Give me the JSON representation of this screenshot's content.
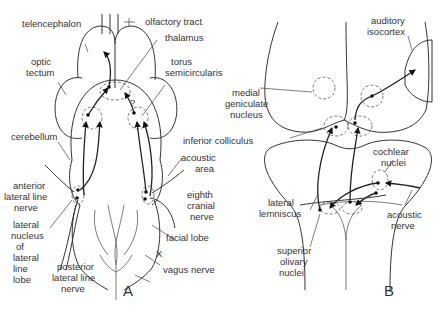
{
  "figure": {
    "panels": [
      {
        "id": "A",
        "label": "A",
        "labels": {
          "telencephalon": "telencephalon",
          "olfactory_tract": "olfactory tract",
          "thalamus": "thalamus",
          "optic_tectum_1": "optic",
          "optic_tectum_2": "tectum",
          "torus_1": "torus",
          "torus_2": "semicircularis",
          "cerebellum": "cerebellum",
          "acoustic_area_1": "acoustic",
          "acoustic_area_2": "area",
          "anterior_lln_1": "anterior",
          "anterior_lln_2": "lateral line",
          "anterior_lln_3": "nerve",
          "eighth_1": "eighth",
          "eighth_2": "cranial",
          "eighth_3": "nerve",
          "lat_nuc_1": "lateral",
          "lat_nuc_2": "nucleus",
          "lat_nuc_3": "of",
          "lat_nuc_4": "lateral",
          "lat_nuc_5": "line",
          "lat_nuc_6": "lobe",
          "facial_lobe": "facial lobe",
          "x": "X",
          "vagus": "vagus nerve",
          "posterior_lln_1": "posterior",
          "posterior_lln_2": "lateral line",
          "posterior_lln_3": "nerve",
          "question": "?"
        }
      },
      {
        "id": "B",
        "label": "B",
        "labels": {
          "auditory_1": "auditory",
          "auditory_2": "isocortex",
          "mgn_1": "medial",
          "mgn_2": "geniculate",
          "mgn_3": "nucleus",
          "inf_coll": "inferior colliculus",
          "cochlear_1": "cochlear",
          "cochlear_2": "nuclei",
          "lat_lem_1": "lateral",
          "lat_lem_2": "lemniscus",
          "acoustic_nerve_1": "acoustic",
          "acoustic_nerve_2": "nerve",
          "son_1": "superior",
          "son_2": "olivary",
          "son_3": "nuclei"
        }
      }
    ]
  }
}
